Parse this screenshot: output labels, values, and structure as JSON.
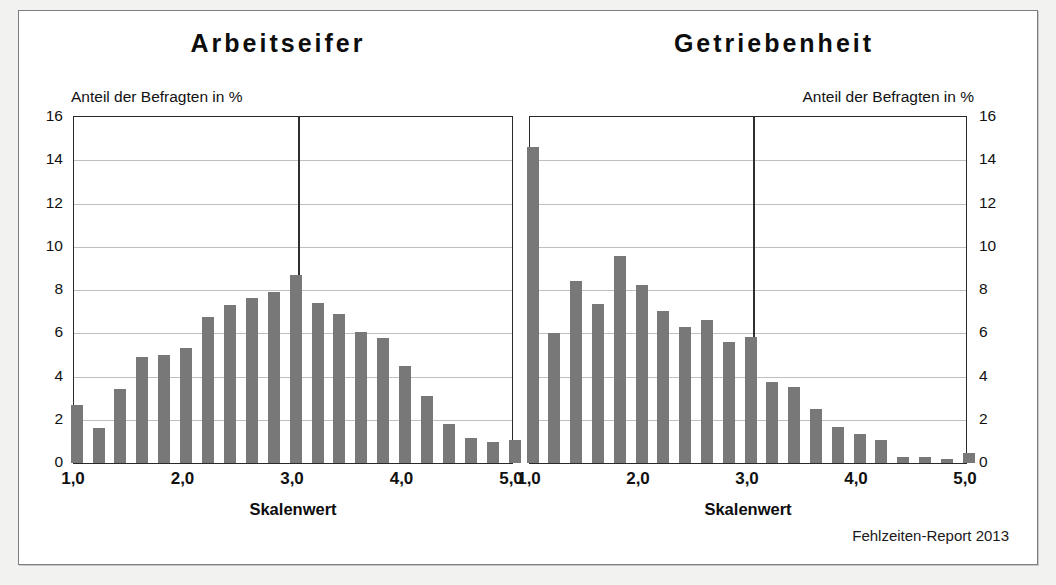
{
  "footer": "Fehlzeiten-Report 2013",
  "colors": {
    "bar": "#787878",
    "axis": "#2a2a2a",
    "grid": "#bfbfbf",
    "refline": "#2f2f2f",
    "page_background": "#f2f2f0",
    "panel_background": "#ffffff"
  },
  "panels": {
    "left": {
      "title": "Arbeitseifer",
      "axis_note": "Anteil der Befragten in %",
      "xaxis_title": "Skalenwert",
      "ytick_labels": [
        "0",
        "2",
        "4",
        "6",
        "8",
        "10",
        "12",
        "14",
        "16"
      ],
      "xtick_labels": [
        "1,0",
        "2,0",
        "3,0",
        "4,0",
        "5,0"
      ]
    },
    "right": {
      "title": "Getriebenheit",
      "axis_note": "Anteil der Befragten in %",
      "xaxis_title": "Skalenwert",
      "ytick_labels": [
        "0",
        "2",
        "4",
        "6",
        "8",
        "10",
        "12",
        "14",
        "16"
      ],
      "xtick_labels": [
        "1,0",
        "2,0",
        "3,0",
        "4,0",
        "5,0"
      ]
    }
  },
  "chart_data": [
    {
      "type": "bar",
      "title": "Arbeitseifer",
      "subtitle": "Anteil der Befragten in %",
      "xlabel": "Skalenwert",
      "ylabel": "Anteil der Befragten in %",
      "ylim": [
        0,
        16
      ],
      "yticks": [
        0,
        2,
        4,
        6,
        8,
        10,
        12,
        14,
        16
      ],
      "xlim": [
        1.0,
        5.0
      ],
      "xticks": [
        1.0,
        2.0,
        3.0,
        4.0,
        5.0
      ],
      "xtick_labels": [
        "1,0",
        "2,0",
        "3,0",
        "4,0",
        "5,0"
      ],
      "grid": "horizontal",
      "legend": "none",
      "annotations": [
        {
          "type": "vertical-reference-line",
          "x": 3.05
        }
      ],
      "x": [
        1.0,
        1.2,
        1.4,
        1.6,
        1.8,
        2.0,
        2.2,
        2.4,
        2.6,
        2.8,
        3.0,
        3.2,
        3.4,
        3.6,
        3.8,
        4.0,
        4.2,
        4.4,
        4.6,
        4.8,
        5.0
      ],
      "values": [
        2.7,
        1.6,
        3.4,
        4.9,
        5.0,
        5.3,
        6.75,
        7.3,
        7.65,
        7.9,
        8.7,
        7.4,
        6.9,
        6.05,
        5.8,
        4.5,
        3.1,
        1.8,
        1.15,
        0.95,
        1.05
      ]
    },
    {
      "type": "bar",
      "title": "Getriebenheit",
      "subtitle": "Anteil der Befragten in %",
      "xlabel": "Skalenwert",
      "ylabel": "Anteil der Befragten in %",
      "ylim": [
        0,
        16
      ],
      "yticks": [
        0,
        2,
        4,
        6,
        8,
        10,
        12,
        14,
        16
      ],
      "xlim": [
        1.0,
        5.0
      ],
      "xticks": [
        1.0,
        2.0,
        3.0,
        4.0,
        5.0
      ],
      "xtick_labels": [
        "1,0",
        "2,0",
        "3,0",
        "4,0",
        "5,0"
      ],
      "grid": "horizontal",
      "legend": "none",
      "annotations": [
        {
          "type": "vertical-reference-line",
          "x": 3.05
        }
      ],
      "x": [
        1.0,
        1.2,
        1.4,
        1.6,
        1.8,
        2.0,
        2.2,
        2.4,
        2.6,
        2.8,
        3.0,
        3.2,
        3.4,
        3.6,
        3.8,
        4.0,
        4.2,
        4.4,
        4.6,
        4.8,
        5.0
      ],
      "values": [
        14.6,
        6.0,
        8.4,
        7.35,
        9.55,
        8.25,
        7.05,
        6.3,
        6.6,
        5.6,
        5.85,
        3.75,
        3.5,
        2.5,
        1.65,
        1.35,
        1.05,
        0.3,
        0.3,
        0.2,
        0.45
      ]
    }
  ]
}
